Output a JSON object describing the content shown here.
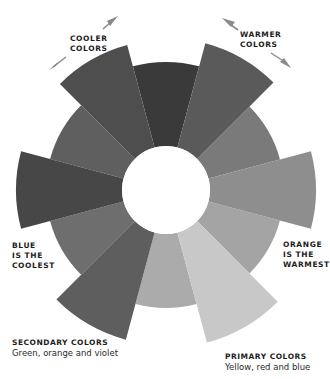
{
  "diagram": {
    "type": "color-wheel",
    "center": [
      166,
      190
    ],
    "inner_radius": 44,
    "segment_span_deg": 30,
    "segments": [
      {
        "angle": -90,
        "outer_radius": 128,
        "color": "#3a3a3a"
      },
      {
        "angle": -60,
        "outer_radius": 152,
        "color": "#5a5a5a"
      },
      {
        "angle": -30,
        "outer_radius": 118,
        "color": "#7a7a7a"
      },
      {
        "angle": 0,
        "outer_radius": 150,
        "color": "#8e8e8e"
      },
      {
        "angle": 30,
        "outer_radius": 118,
        "color": "#a4a4a4"
      },
      {
        "angle": 60,
        "outer_radius": 158,
        "color": "#c8c8c8"
      },
      {
        "angle": 90,
        "outer_radius": 118,
        "color": "#ababab"
      },
      {
        "angle": 120,
        "outer_radius": 155,
        "color": "#5e5e5e"
      },
      {
        "angle": 150,
        "outer_radius": 120,
        "color": "#6e6e6e"
      },
      {
        "angle": 180,
        "outer_radius": 150,
        "color": "#474747"
      },
      {
        "angle": 210,
        "outer_radius": 120,
        "color": "#5f5f5f"
      },
      {
        "angle": 240,
        "outer_radius": 150,
        "color": "#4e4e4e"
      }
    ],
    "arrow_color": "#8a8a8a"
  },
  "labels": {
    "cooler": [
      "COOLER",
      "COLORS"
    ],
    "warmer": [
      "WARMER",
      "COLORS"
    ],
    "blue": [
      "BLUE",
      "IS THE",
      "COOLEST"
    ],
    "orange": [
      "ORANGE",
      "IS THE",
      "WARMEST"
    ]
  },
  "captions": {
    "secondary": {
      "title": "SECONDARY COLORS",
      "text": "Green, orange and violet"
    },
    "primary": {
      "title": "PRIMARY COLORS",
      "text": "Yellow, red and blue"
    }
  }
}
